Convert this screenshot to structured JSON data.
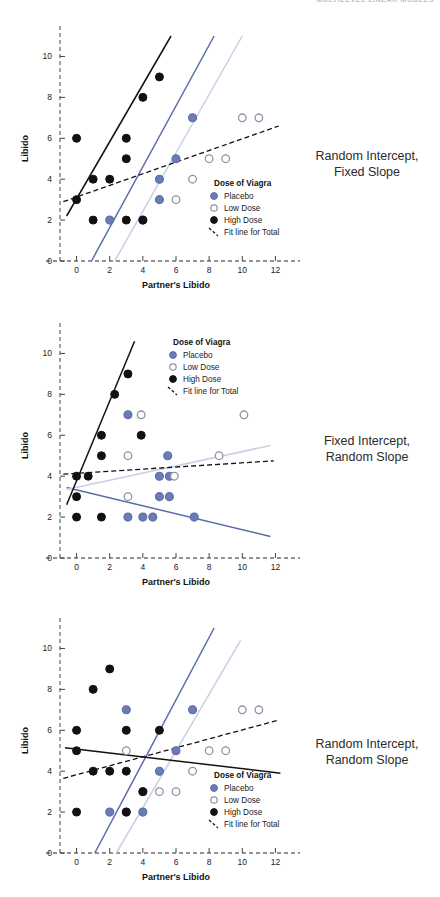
{
  "header": {
    "strip_text": "MULTILEVEL LINEAR MODELS"
  },
  "axes": {
    "xlabel": "Partner's Libido",
    "ylabel": "Libido",
    "xticks": [
      0,
      2,
      4,
      6,
      8,
      10,
      12
    ],
    "yticks": [
      0,
      2,
      4,
      6,
      8,
      10
    ],
    "xlim": [
      -1,
      13
    ],
    "ylim": [
      0,
      11
    ]
  },
  "legend": {
    "title": "Dose of Viagra",
    "items": [
      {
        "label": "Placebo",
        "marker": "filled-blue-circle-icon"
      },
      {
        "label": "Low Dose",
        "marker": "open-circle-icon"
      },
      {
        "label": "High Dose",
        "marker": "filled-black-circle-icon"
      },
      {
        "label": "Fit line for Total",
        "marker": "dashed-line-icon"
      }
    ]
  },
  "colors": {
    "placebo": "#5b6ca8",
    "placebo_fill": "#6a7bb5",
    "low_dose": "#8d93a8",
    "low_dose_line": "#c8cfe6",
    "high_dose": "#111111",
    "fit_line": "#111111",
    "axis": "#6f6f6f"
  },
  "captions": {
    "panel1_line1": "Random Intercept,",
    "panel1_line2": "Fixed Slope",
    "panel2_line1": "Fixed Intercept,",
    "panel2_line2": "Random Slope",
    "panel3_line1": "Random Intercept,",
    "panel3_line2": "Random Slope"
  },
  "chart_data": [
    {
      "type": "scatter",
      "title": "Random Intercept, Fixed Slope",
      "xlabel": "Partner's Libido",
      "ylabel": "Libido",
      "xlim": [
        -1,
        13
      ],
      "ylim": [
        0,
        11
      ],
      "grid": false,
      "legend_position": "lower-right",
      "series": [
        {
          "name": "Placebo",
          "points": [
            [
              5,
              4
            ],
            [
              6,
              5
            ],
            [
              7,
              7
            ],
            [
              5,
              3
            ],
            [
              2,
              2
            ],
            [
              4,
              2
            ]
          ]
        },
        {
          "name": "Low Dose",
          "points": [
            [
              6,
              3
            ],
            [
              7,
              4
            ],
            [
              8,
              5
            ],
            [
              9,
              5
            ],
            [
              10,
              7
            ],
            [
              11,
              7
            ]
          ]
        },
        {
          "name": "High Dose",
          "points": [
            [
              0,
              3
            ],
            [
              0,
              6
            ],
            [
              1,
              4
            ],
            [
              1,
              2
            ],
            [
              2,
              4
            ],
            [
              3,
              5
            ],
            [
              3,
              6
            ],
            [
              3,
              2
            ],
            [
              4,
              2
            ],
            [
              4,
              8
            ],
            [
              5,
              9
            ]
          ]
        }
      ],
      "lines": [
        {
          "name": "Placebo fit",
          "color": "#5b6ca8",
          "style": "solid",
          "x": [
            0.9,
            8.3
          ],
          "y": [
            0,
            11
          ]
        },
        {
          "name": "Low Dose fit",
          "color": "#c8cfe6",
          "style": "solid",
          "x": [
            2.3,
            10.0
          ],
          "y": [
            0,
            11
          ]
        },
        {
          "name": "High Dose fit",
          "color": "#111111",
          "style": "solid",
          "x": [
            -0.6,
            5.7
          ],
          "y": [
            2.2,
            11
          ]
        },
        {
          "name": "Fit line for Total",
          "color": "#111111",
          "style": "dashed",
          "x": [
            -0.8,
            12.2
          ],
          "y": [
            2.9,
            6.6
          ]
        }
      ]
    },
    {
      "type": "scatter",
      "title": "Fixed Intercept, Random Slope",
      "xlabel": "Partner's Libido",
      "ylabel": "Libido",
      "xlim": [
        -1,
        13
      ],
      "ylim": [
        0,
        11
      ],
      "grid": false,
      "legend_position": "upper-middle",
      "series": [
        {
          "name": "Placebo",
          "points": [
            [
              3.1,
              7
            ],
            [
              5.5,
              5
            ],
            [
              5.0,
              4
            ],
            [
              5.6,
              4
            ],
            [
              5.0,
              3
            ],
            [
              5.6,
              3
            ],
            [
              3.1,
              2
            ],
            [
              4.0,
              2
            ],
            [
              4.6,
              2
            ],
            [
              7.1,
              2
            ]
          ]
        },
        {
          "name": "Low Dose",
          "points": [
            [
              3.9,
              7
            ],
            [
              10.1,
              7
            ],
            [
              8.6,
              5
            ],
            [
              3.1,
              5
            ],
            [
              5.9,
              4
            ],
            [
              3.1,
              3
            ]
          ]
        },
        {
          "name": "High Dose",
          "points": [
            [
              3.1,
              9
            ],
            [
              2.3,
              8
            ],
            [
              1.5,
              6
            ],
            [
              3.9,
              6
            ],
            [
              1.5,
              5
            ],
            [
              0.0,
              4
            ],
            [
              0.7,
              4
            ],
            [
              0.0,
              3
            ],
            [
              0.0,
              2
            ],
            [
              1.5,
              2
            ]
          ]
        }
      ],
      "lines": [
        {
          "name": "Placebo fit",
          "color": "#5b6ca8",
          "style": "solid",
          "x": [
            -0.6,
            11.7
          ],
          "y": [
            3.45,
            1.05
          ]
        },
        {
          "name": "Low Dose fit",
          "color": "#c8cfe6",
          "style": "solid",
          "x": [
            -0.6,
            11.7
          ],
          "y": [
            3.35,
            5.5
          ]
        },
        {
          "name": "High Dose fit",
          "color": "#111111",
          "style": "solid",
          "x": [
            -0.6,
            3.5
          ],
          "y": [
            2.6,
            10.6
          ]
        },
        {
          "name": "Fit line for Total",
          "color": "#111111",
          "style": "dashed",
          "x": [
            -0.8,
            11.9
          ],
          "y": [
            4.1,
            4.75
          ]
        }
      ]
    },
    {
      "type": "scatter",
      "title": "Random Intercept, Random Slope",
      "xlabel": "Partner's Libido",
      "ylabel": "Libido",
      "xlim": [
        -1,
        13
      ],
      "ylim": [
        0,
        11
      ],
      "grid": false,
      "legend_position": "lower-right",
      "series": [
        {
          "name": "Placebo",
          "points": [
            [
              3,
              7
            ],
            [
              7,
              7
            ],
            [
              6,
              5
            ],
            [
              5,
              4
            ],
            [
              4,
              3
            ],
            [
              2,
              2
            ],
            [
              3,
              2
            ],
            [
              4,
              2
            ]
          ]
        },
        {
          "name": "Low Dose",
          "points": [
            [
              10,
              7
            ],
            [
              11,
              7
            ],
            [
              8,
              5
            ],
            [
              9,
              5
            ],
            [
              3,
              5
            ],
            [
              7,
              4
            ],
            [
              5,
              3
            ],
            [
              6,
              3
            ]
          ]
        },
        {
          "name": "High Dose",
          "points": [
            [
              2,
              9
            ],
            [
              1,
              8
            ],
            [
              0,
              6
            ],
            [
              3,
              6
            ],
            [
              5,
              6
            ],
            [
              0,
              5
            ],
            [
              1,
              4
            ],
            [
              2,
              4
            ],
            [
              3,
              4
            ],
            [
              4,
              3
            ],
            [
              0,
              2
            ],
            [
              3,
              2
            ]
          ]
        }
      ],
      "lines": [
        {
          "name": "Placebo fit",
          "color": "#5b6ca8",
          "style": "solid",
          "x": [
            1.1,
            8.3
          ],
          "y": [
            0,
            11
          ]
        },
        {
          "name": "Low Dose fit",
          "color": "#c8cfe6",
          "style": "solid",
          "x": [
            2.4,
            9.9
          ],
          "y": [
            0,
            10.4
          ]
        },
        {
          "name": "High Dose fit",
          "color": "#111111",
          "style": "solid",
          "x": [
            -0.7,
            12.3
          ],
          "y": [
            5.15,
            3.9
          ]
        },
        {
          "name": "Fit line for Total",
          "color": "#111111",
          "style": "dashed",
          "x": [
            -0.8,
            12.2
          ],
          "y": [
            3.65,
            6.5
          ]
        }
      ]
    }
  ]
}
